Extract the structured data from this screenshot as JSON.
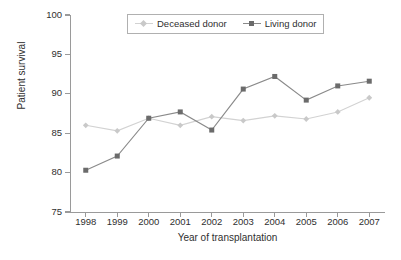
{
  "chart_data": {
    "type": "line",
    "title": "",
    "xlabel": "Year of transplantation",
    "ylabel": "Patient survival",
    "x": [
      1998,
      1999,
      2000,
      2001,
      2002,
      2003,
      2004,
      2005,
      2006,
      2007
    ],
    "categories": [
      "1998",
      "1999",
      "2000",
      "2001",
      "2002",
      "2003",
      "2004",
      "2005",
      "2006",
      "2007"
    ],
    "xlim": [
      1997.5,
      2007.5
    ],
    "ylim": [
      75,
      100
    ],
    "yticks": [
      75,
      80,
      85,
      90,
      95,
      100
    ],
    "ytick_labels": [
      "75",
      "80",
      "85",
      "90",
      "95",
      "100"
    ],
    "grid": false,
    "legend_position": "top-center",
    "series": [
      {
        "name": "Deceased donor",
        "marker": "diamond",
        "color": "#c9c9c9",
        "line_color": "#d2d2d2",
        "values": [
          86.0,
          85.3,
          86.9,
          86.0,
          87.1,
          86.6,
          87.2,
          86.8,
          87.7,
          89.5
        ]
      },
      {
        "name": "Living donor",
        "marker": "square",
        "color": "#6b6b6b",
        "line_color": "#8a8a8a",
        "values": [
          80.3,
          82.1,
          86.9,
          87.7,
          85.4,
          90.6,
          92.2,
          89.2,
          91.0,
          91.6
        ]
      }
    ]
  },
  "axis": {
    "y_title": "Patient survival",
    "x_title": "Year of transplantation"
  },
  "legend": {
    "items": [
      {
        "label": "Deceased donor"
      },
      {
        "label": "Living donor"
      }
    ]
  },
  "colors": {
    "deceased": "#c9c9c9",
    "living": "#6b6b6b",
    "axis": "#9a9a9a",
    "text": "#2f2f2f",
    "background": "#ffffff"
  }
}
